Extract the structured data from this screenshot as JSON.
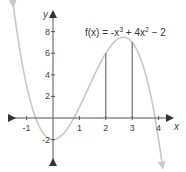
{
  "chart_data": {
    "type": "line",
    "function_label": {
      "fx": "f(x) = -x",
      "exp1": "3",
      "mid": " + 4x",
      "exp2": "2",
      "tail": " − 2"
    },
    "xlabel": "x",
    "ylabel": "y",
    "x_ticks": [
      {
        "value": -1,
        "label": "-1"
      },
      {
        "value": 1,
        "label": "1"
      },
      {
        "value": 2,
        "label": "2"
      },
      {
        "value": 3,
        "label": "3"
      },
      {
        "value": 4,
        "label": "4"
      }
    ],
    "y_ticks": [
      {
        "value": 8,
        "label": "8"
      },
      {
        "value": 6,
        "label": "6"
      },
      {
        "value": 4,
        "label": "4"
      },
      {
        "value": 2,
        "label": "2"
      },
      {
        "value": -2,
        "label": "-2"
      }
    ],
    "xlim": [
      -2,
      5
    ],
    "ylim": [
      -4,
      10
    ],
    "grid": false,
    "vertical_lines": [
      {
        "x": 2,
        "y": 6
      },
      {
        "x": 3,
        "y": 7
      }
    ],
    "series": [
      {
        "name": "f(x) = -x^3 + 4x^2 - 2",
        "x": [
          -1.5,
          -1,
          -0.5,
          0,
          0.5,
          1,
          1.5,
          2,
          2.5,
          2.67,
          3,
          3.5,
          4,
          4.15
        ],
        "values": [
          10.38,
          3,
          -0.88,
          -2,
          -1.13,
          1,
          3.63,
          6,
          7.38,
          7.48,
          7,
          4.13,
          -2,
          -3.4
        ]
      }
    ],
    "colors": {
      "curve": "#c8c8c8",
      "axes": "#555555",
      "verticals": "#555555"
    }
  }
}
